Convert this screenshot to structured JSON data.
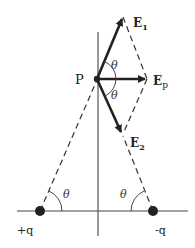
{
  "diagram": {
    "title": "",
    "point_label": "P",
    "vectors": [
      {
        "label": "E",
        "sub": "1"
      },
      {
        "label": "E",
        "sub": "p"
      },
      {
        "label": "E",
        "sub": "2"
      }
    ],
    "angle_symbol": "θ",
    "charges": [
      {
        "label": "+q"
      },
      {
        "label": "-q"
      }
    ],
    "colors": {
      "line": "#2a2a2a",
      "vector": "#222222",
      "background": "#ffffff"
    }
  }
}
